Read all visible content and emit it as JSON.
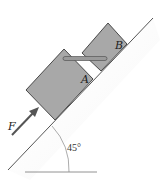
{
  "diagram": {
    "type": "physics-free-body",
    "labels": {
      "block_a": "A",
      "block_b": "B",
      "force": "F",
      "angle": "45°"
    },
    "colors": {
      "block_fill": "#a8a8a8",
      "block_stroke": "#3a3a3a",
      "rod_fill": "#9a9a9a",
      "arrow": "#555555",
      "line": "#555555"
    },
    "incline_angle_deg": 45
  }
}
